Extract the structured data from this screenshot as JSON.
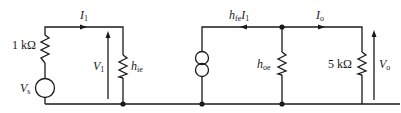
{
  "diagram": {
    "type": "h-parameter small-signal equivalent circuit",
    "labels": {
      "input_current": "I",
      "input_current_sub": "1",
      "source_resistor": "1 kΩ",
      "source_voltage": "V",
      "source_voltage_sub": "s",
      "input_voltage": "V",
      "input_voltage_sub": "1",
      "input_impedance": "h",
      "input_impedance_sub": "ie",
      "dependent_source": "h",
      "dependent_source_sub": "fe",
      "dependent_source_tail": "I",
      "dependent_source_tail_sub": "1",
      "output_admittance": "h",
      "output_admittance_sub": "oe",
      "output_current": "I",
      "output_current_sub": "o",
      "load_resistor": "5 kΩ",
      "output_voltage": "V",
      "output_voltage_sub": "o"
    },
    "components": [
      {
        "id": "Vs",
        "kind": "voltage-source"
      },
      {
        "id": "R1k",
        "kind": "resistor",
        "value": "1 kΩ"
      },
      {
        "id": "hie",
        "kind": "resistor"
      },
      {
        "id": "hfeI1",
        "kind": "current-source"
      },
      {
        "id": "hoe",
        "kind": "resistor"
      },
      {
        "id": "R5k",
        "kind": "resistor",
        "value": "5 kΩ"
      }
    ],
    "colors": {
      "ink": "#1a1a1a",
      "background": "#ffffff"
    }
  }
}
